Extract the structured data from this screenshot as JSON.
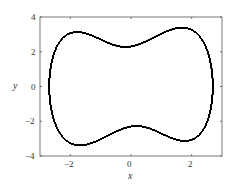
{
  "chart_data": {
    "type": "line",
    "title": "",
    "xlabel": "x",
    "ylabel": "y",
    "xlim": [
      -3,
      3
    ],
    "ylim": [
      -4,
      4
    ],
    "xticks": [
      -2,
      0,
      2
    ],
    "yticks": [
      -4,
      -2,
      0,
      2,
      4
    ],
    "xtick_labels": [
      "−2",
      "0",
      "2"
    ],
    "ytick_labels": [
      "−4",
      "−2",
      "0",
      "2",
      "4"
    ],
    "grid": false,
    "legend": null,
    "series": [
      {
        "name": "trajectory",
        "color": "#000000",
        "model": "forced Duffing: x'' + d x' - a x + b x^3 = F cos(w t)",
        "x_extent": [
          -2.7,
          2.7
        ],
        "y_extent": [
          -3.4,
          3.4
        ],
        "lobe_centers": [
          [
            -1,
            0
          ],
          [
            1,
            0
          ]
        ]
      }
    ]
  },
  "axes": {
    "x_tick_labels": [
      "−2",
      "0",
      "2"
    ],
    "y_tick_labels": [
      "4",
      "2",
      "0",
      "−2",
      "−4"
    ],
    "xlabel": "x",
    "ylabel": "y"
  },
  "style": {
    "line_color": "#000000",
    "axis_color": "#555555"
  }
}
